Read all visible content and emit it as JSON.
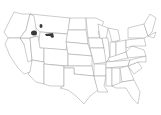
{
  "map": {
    "region": "United States (contiguous)",
    "style": {
      "background": "#ffffff",
      "state_fill": "#ffffff",
      "state_stroke": "#9a9a9a",
      "highlight_fill": "#3a3a3a"
    },
    "highlighted_areas": [
      {
        "state": "Montana",
        "label": "western patch"
      },
      {
        "state": "Montana",
        "label": "north-central patch"
      },
      {
        "state": "Montana",
        "label": "central patch"
      }
    ]
  }
}
